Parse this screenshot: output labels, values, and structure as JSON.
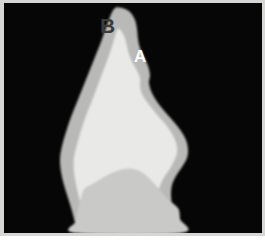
{
  "figure": {
    "kind": "grayscale-micrograph",
    "width": 265,
    "height": 246,
    "background_color": "#ffffff",
    "plate_background_color": "#060606",
    "frame_color": "#d6d6d4"
  },
  "annotations": [
    {
      "id": "B",
      "label": "B",
      "color": "#3b3b3b",
      "x": 96,
      "y": 12,
      "font_size": 21,
      "target_region": "outer-dark-gray-layer"
    },
    {
      "id": "A",
      "label": "A",
      "color": "#fdfdfd",
      "x": 130,
      "y": 45,
      "font_size": 17,
      "target_region": "inner-light-core"
    }
  ],
  "regions": [
    {
      "name": "outer-gray-rim",
      "fill": "#b9b9b7",
      "description": "thin medium-gray band tracing the outline of the crown, widest at the apex where label B points"
    },
    {
      "name": "inner-light-core",
      "fill": "#e9e9e7",
      "description": "large pale near-white body filling most of the crown, indicated by label A"
    },
    {
      "name": "basal-gray-band",
      "fill": "#c9c9c7",
      "description": "medium-gray zone across the lower third of the specimen with an arched upper boundary"
    },
    {
      "name": "plate-background",
      "fill": "#060606",
      "description": "black mounting field surrounding the specimen"
    }
  ],
  "chart_data": {
    "type": "scatter",
    "title": "",
    "xlabel": "",
    "ylabel": "",
    "grid": false,
    "legend": null,
    "xlim": [
      0,
      258
    ],
    "ylim": [
      0,
      230
    ],
    "series": [
      {
        "name": "outer-gray-rim-outline",
        "fill": "#b9b9b7",
        "closed": true,
        "points": [
          [
            110,
            6
          ],
          [
            118,
            5
          ],
          [
            126,
            9
          ],
          [
            131,
            17
          ],
          [
            133,
            26
          ],
          [
            134,
            36
          ],
          [
            136,
            45
          ],
          [
            140,
            54
          ],
          [
            144,
            63
          ],
          [
            146,
            72
          ],
          [
            145,
            80
          ],
          [
            148,
            90
          ],
          [
            154,
            100
          ],
          [
            162,
            110
          ],
          [
            170,
            119
          ],
          [
            177,
            128
          ],
          [
            182,
            137
          ],
          [
            184,
            146
          ],
          [
            183,
            155
          ],
          [
            178,
            164
          ],
          [
            172,
            173
          ],
          [
            168,
            182
          ],
          [
            167,
            192
          ],
          [
            168,
            202
          ],
          [
            170,
            212
          ],
          [
            172,
            222
          ],
          [
            173,
            230
          ],
          [
            73,
            230
          ],
          [
            71,
            220
          ],
          [
            68,
            208
          ],
          [
            64,
            195
          ],
          [
            60,
            182
          ],
          [
            57,
            169
          ],
          [
            56,
            156
          ],
          [
            58,
            143
          ],
          [
            62,
            129
          ],
          [
            67,
            114
          ],
          [
            73,
            99
          ],
          [
            79,
            84
          ],
          [
            85,
            69
          ],
          [
            91,
            54
          ],
          [
            97,
            39
          ],
          [
            103,
            22
          ]
        ]
      },
      {
        "name": "inner-light-core-outline",
        "fill": "#e9e9e7",
        "closed": true,
        "points": [
          [
            114,
            26
          ],
          [
            119,
            31
          ],
          [
            122,
            39
          ],
          [
            124,
            48
          ],
          [
            127,
            57
          ],
          [
            132,
            66
          ],
          [
            136,
            75
          ],
          [
            136,
            84
          ],
          [
            139,
            93
          ],
          [
            146,
            103
          ],
          [
            154,
            113
          ],
          [
            162,
            122
          ],
          [
            168,
            131
          ],
          [
            172,
            140
          ],
          [
            173,
            149
          ],
          [
            170,
            158
          ],
          [
            165,
            167
          ],
          [
            159,
            176
          ],
          [
            155,
            186
          ],
          [
            154,
            196
          ],
          [
            155,
            207
          ],
          [
            157,
            218
          ],
          [
            159,
            230
          ],
          [
            84,
            230
          ],
          [
            81,
            219
          ],
          [
            78,
            207
          ],
          [
            75,
            194
          ],
          [
            72,
            181
          ],
          [
            70,
            168
          ],
          [
            70,
            155
          ],
          [
            73,
            142
          ],
          [
            77,
            128
          ],
          [
            82,
            113
          ],
          [
            88,
            98
          ],
          [
            94,
            82
          ],
          [
            100,
            66
          ],
          [
            106,
            50
          ],
          [
            110,
            37
          ]
        ]
      },
      {
        "name": "basal-gray-band-outline",
        "fill": "#c9c9c7",
        "closed": true,
        "points": [
          [
            80,
            186
          ],
          [
            90,
            180
          ],
          [
            100,
            174
          ],
          [
            110,
            169
          ],
          [
            120,
            166
          ],
          [
            130,
            166
          ],
          [
            139,
            170
          ],
          [
            147,
            177
          ],
          [
            154,
            185
          ],
          [
            160,
            192
          ],
          [
            166,
            198
          ],
          [
            172,
            203
          ],
          [
            175,
            207
          ],
          [
            176,
            216
          ],
          [
            177,
            230
          ],
          [
            72,
            230
          ],
          [
            72,
            218
          ],
          [
            74,
            206
          ],
          [
            77,
            195
          ]
        ]
      }
    ]
  }
}
